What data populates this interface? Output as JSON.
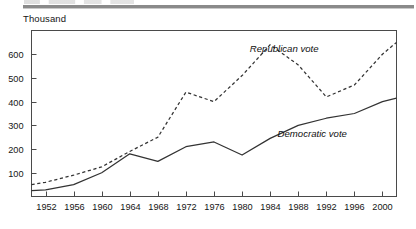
{
  "header": {
    "unit_label": "Thousand"
  },
  "chart_data": {
    "type": "line",
    "title": "",
    "subtitle": "",
    "xlabel": "",
    "ylabel": "Thousand",
    "grid": false,
    "legend_position": "inline-annotation",
    "xlim": [
      1950,
      2002
    ],
    "ylim": [
      0,
      700
    ],
    "yticks": [
      100,
      200,
      300,
      400,
      500,
      600
    ],
    "ytick_labels": [
      "100",
      "200",
      "300",
      "400",
      "500",
      "600"
    ],
    "xticks": [
      1952,
      1956,
      1960,
      1964,
      1968,
      1972,
      1976,
      1980,
      1984,
      1988,
      1992,
      1996,
      2000
    ],
    "xtick_labels": [
      "1952",
      "1956",
      "1960",
      "1964",
      "1968",
      "1972",
      "1976",
      "1980",
      "1984",
      "1988",
      "1992",
      "1996",
      "2000"
    ],
    "x": [
      1950,
      1952,
      1956,
      1960,
      1964,
      1968,
      1972,
      1976,
      1980,
      1984,
      1988,
      1992,
      1996,
      2000,
      2002
    ],
    "series": [
      {
        "name": "Republican vote",
        "label": "Republican vote",
        "style": "dashed",
        "color": "#333333",
        "annotation": {
          "text": "Republican vote",
          "x": 1986,
          "y": 610
        },
        "values": [
          50,
          60,
          90,
          125,
          190,
          250,
          440,
          400,
          510,
          640,
          555,
          420,
          470,
          600,
          650
        ]
      },
      {
        "name": "Democratic vote",
        "label": "Democratic vote",
        "style": "solid",
        "color": "#333333",
        "annotation": {
          "text": "Democratic vote",
          "x": 1990,
          "y": 250
        },
        "values": [
          25,
          28,
          50,
          100,
          180,
          148,
          210,
          230,
          175,
          245,
          300,
          330,
          350,
          400,
          415
        ]
      }
    ]
  }
}
